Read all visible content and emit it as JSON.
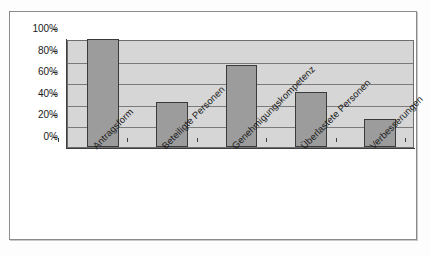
{
  "chart_data": {
    "type": "bar",
    "title": "",
    "subtitle": "",
    "xlabel": "",
    "ylabel": "",
    "categories": [
      "Antragsform",
      "Beteiligte Personen",
      "Genehmigungskompetenz",
      "Überlastete Personen",
      "Verbesserungen"
    ],
    "values": [
      100,
      42,
      76,
      51,
      26
    ],
    "ylim": [
      0,
      100
    ],
    "ytick_labels": [
      "100%",
      "80%",
      "60%",
      "40%",
      "20%",
      "0%"
    ],
    "ytick_values": [
      100,
      80,
      60,
      40,
      20,
      0
    ],
    "grid": true,
    "legend": false,
    "series": [
      {
        "name": "",
        "values": [
          100,
          42,
          76,
          51,
          26
        ]
      }
    ]
  },
  "style": {
    "bar_fill": "#9c9c9c",
    "bar_stroke": "#3a3a3a",
    "plot_fill": "#d6d6d6",
    "grid_color": "#7a7a7a",
    "axis_color": "#3d3d3d",
    "frame_color": "#8a8a8a",
    "page_bg": "#fdfdfd"
  }
}
